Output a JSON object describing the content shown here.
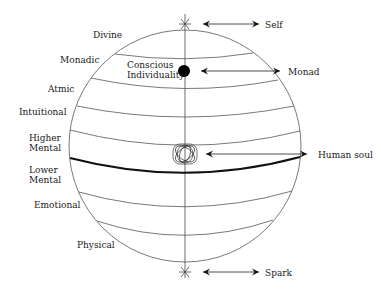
{
  "diagram": {
    "type": "planes-of-consciousness-sphere",
    "planes": [
      {
        "label": "Divine",
        "x": 93,
        "y": 37
      },
      {
        "label": "Monadic",
        "x": 60,
        "y": 62
      },
      {
        "label": "Atmic",
        "x": 48,
        "y": 90
      },
      {
        "label": "Intuitional",
        "x": 19,
        "y": 114
      },
      {
        "label_line1": "Higher",
        "label_line2": "Mental",
        "x": 29,
        "y": 144
      },
      {
        "label_line1": "Lower",
        "label_line2": "Mental",
        "x": 29,
        "y": 175
      },
      {
        "label": "Emotional",
        "x": 34,
        "y": 207
      },
      {
        "label": "Physical",
        "x": 77,
        "y": 247
      }
    ],
    "inner_label": {
      "line1": "Conscious",
      "line2": "Individuality"
    },
    "pointers": [
      {
        "label": "Self",
        "y": 24
      },
      {
        "label": "Monad",
        "y": 71
      },
      {
        "label": "Human soul",
        "y": 154
      },
      {
        "label": "Spark",
        "y": 272
      }
    ],
    "colors": {
      "line": "#555555",
      "thick_line": "#111111",
      "text": "#1a1a1a",
      "background": "#ffffff"
    }
  }
}
